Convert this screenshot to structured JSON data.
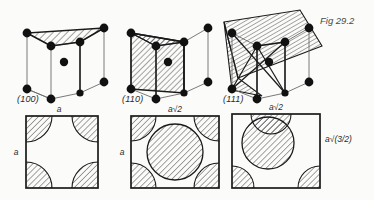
{
  "figure": {
    "caption": "Fig 29.2"
  },
  "colors": {
    "ink": "#1a1a1a",
    "thin_line": "#6b6b6b",
    "hatch": "#2a2a2a",
    "background": "#fbfbfa",
    "atom": "#111111"
  },
  "cells": [
    {
      "id": "cube-100",
      "plane_label": "(100)",
      "plane_type": "top-face",
      "atoms_corner": 8,
      "atoms_body_centre": 1
    },
    {
      "id": "cube-110",
      "plane_label": "(110)",
      "plane_type": "vertical-diagonal",
      "atoms_corner": 8,
      "atoms_body_centre": 1
    },
    {
      "id": "cube-111",
      "plane_label": "(111)",
      "plane_type": "tilted-triangular",
      "atoms_corner": 8,
      "atoms_body_centre": 1
    }
  ],
  "sections": [
    {
      "id": "section-100",
      "top_label": "a",
      "left_label": "a",
      "right_label": "",
      "circles": "four corner quarter circles"
    },
    {
      "id": "section-110",
      "top_label": "a√2",
      "left_label": "a",
      "right_label": "",
      "circles": "central full circle plus four corner quarter circles"
    },
    {
      "id": "section-111",
      "top_label": "a√2",
      "left_label": "",
      "right_label": "a√(3/2)",
      "circles": "central full circle, top half circle, two bottom corner quarter circles"
    }
  ]
}
